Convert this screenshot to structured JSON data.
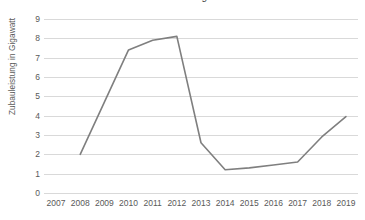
{
  "chart_data": {
    "type": "line",
    "title": "Zubau von Photovoltaikanlagen in Deutschland",
    "xlabel": "",
    "ylabel": "Zubauleistung in Gigawatt",
    "categories": [
      "2007",
      "2008",
      "2009",
      "2010",
      "2011",
      "2012",
      "2013",
      "2014",
      "2015",
      "2016",
      "2017",
      "2018",
      "2019"
    ],
    "x": [
      2007,
      2008,
      2009,
      2010,
      2011,
      2012,
      2013,
      2014,
      2015,
      2016,
      2017,
      2018,
      2019
    ],
    "values": [
      null,
      2.0,
      4.7,
      7.4,
      7.9,
      8.1,
      2.6,
      1.2,
      1.3,
      1.45,
      1.6,
      2.9,
      3.95
    ],
    "series": [
      {
        "name": "Zubauleistung",
        "values": [
          null,
          2.0,
          4.7,
          7.4,
          7.9,
          8.1,
          2.6,
          1.2,
          1.3,
          1.45,
          1.6,
          2.9,
          3.95
        ],
        "color": "#7f7f7f"
      }
    ],
    "ylim": [
      0,
      9
    ],
    "yticks": [
      0,
      1,
      2,
      3,
      4,
      5,
      6,
      7,
      8,
      9
    ],
    "ytick_labels": [
      "0",
      "1",
      "2",
      "3",
      "4",
      "5",
      "6",
      "7",
      "8",
      "9"
    ],
    "grid": true,
    "grid_axis": "y",
    "grid_color": "#d9d9d9",
    "legend": false,
    "legend_position": "none",
    "markers": false,
    "line_width": 1.6,
    "background_color": "#ffffff",
    "text_color": "#595959"
  }
}
